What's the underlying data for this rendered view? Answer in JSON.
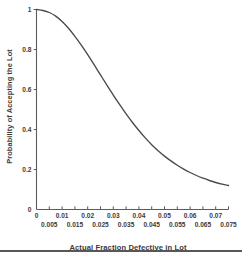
{
  "chart_data": {
    "type": "line",
    "title": "",
    "xlabel": "Actual Fraction Defective in Lot",
    "ylabel": "Probability of Accepting the Lot",
    "xlim": [
      0,
      0.075
    ],
    "ylim": [
      0,
      1
    ],
    "grid": false,
    "legend": "none",
    "line_color": "#4a4a4a",
    "axis_color": "#5a5c60",
    "x_ticks_upper_row": [
      "0",
      "0.01",
      "0.02",
      "0.03",
      "0.04",
      "0.05",
      "0.06",
      "0.07"
    ],
    "x_ticks_lower_row": [
      "0.005",
      "0.015",
      "0.025",
      "0.035",
      "0.045",
      "0.055",
      "0.065",
      "0.075"
    ],
    "x_tick_values": [
      0,
      0.005,
      0.01,
      0.015,
      0.02,
      0.025,
      0.03,
      0.035,
      0.04,
      0.045,
      0.05,
      0.055,
      0.06,
      0.065,
      0.07,
      0.075
    ],
    "y_ticks": [
      "0",
      "0.2",
      "0.4",
      "0.6",
      "0.8",
      "1"
    ],
    "y_tick_values": [
      0,
      0.2,
      0.4,
      0.6,
      0.8,
      1
    ],
    "x": [
      0,
      0.0025,
      0.005,
      0.0075,
      0.01,
      0.0125,
      0.015,
      0.0175,
      0.02,
      0.0225,
      0.025,
      0.0275,
      0.03,
      0.0325,
      0.035,
      0.0375,
      0.04,
      0.0425,
      0.045,
      0.0475,
      0.05,
      0.0525,
      0.055,
      0.0575,
      0.06,
      0.0625,
      0.065,
      0.0675,
      0.07,
      0.0725,
      0.075
    ],
    "y": [
      1.0,
      0.995,
      0.985,
      0.967,
      0.94,
      0.906,
      0.866,
      0.822,
      0.774,
      0.724,
      0.673,
      0.622,
      0.572,
      0.524,
      0.478,
      0.435,
      0.395,
      0.358,
      0.324,
      0.294,
      0.267,
      0.243,
      0.221,
      0.202,
      0.185,
      0.17,
      0.157,
      0.145,
      0.135,
      0.127,
      0.12
    ],
    "series": [
      {
        "name": "Operating Characteristic Curve",
        "values": [
          1.0,
          0.995,
          0.985,
          0.967,
          0.94,
          0.906,
          0.866,
          0.822,
          0.774,
          0.724,
          0.673,
          0.622,
          0.572,
          0.524,
          0.478,
          0.435,
          0.395,
          0.358,
          0.324,
          0.294,
          0.267,
          0.243,
          0.221,
          0.202,
          0.185,
          0.17,
          0.157,
          0.145,
          0.135,
          0.127,
          0.12
        ]
      }
    ]
  }
}
